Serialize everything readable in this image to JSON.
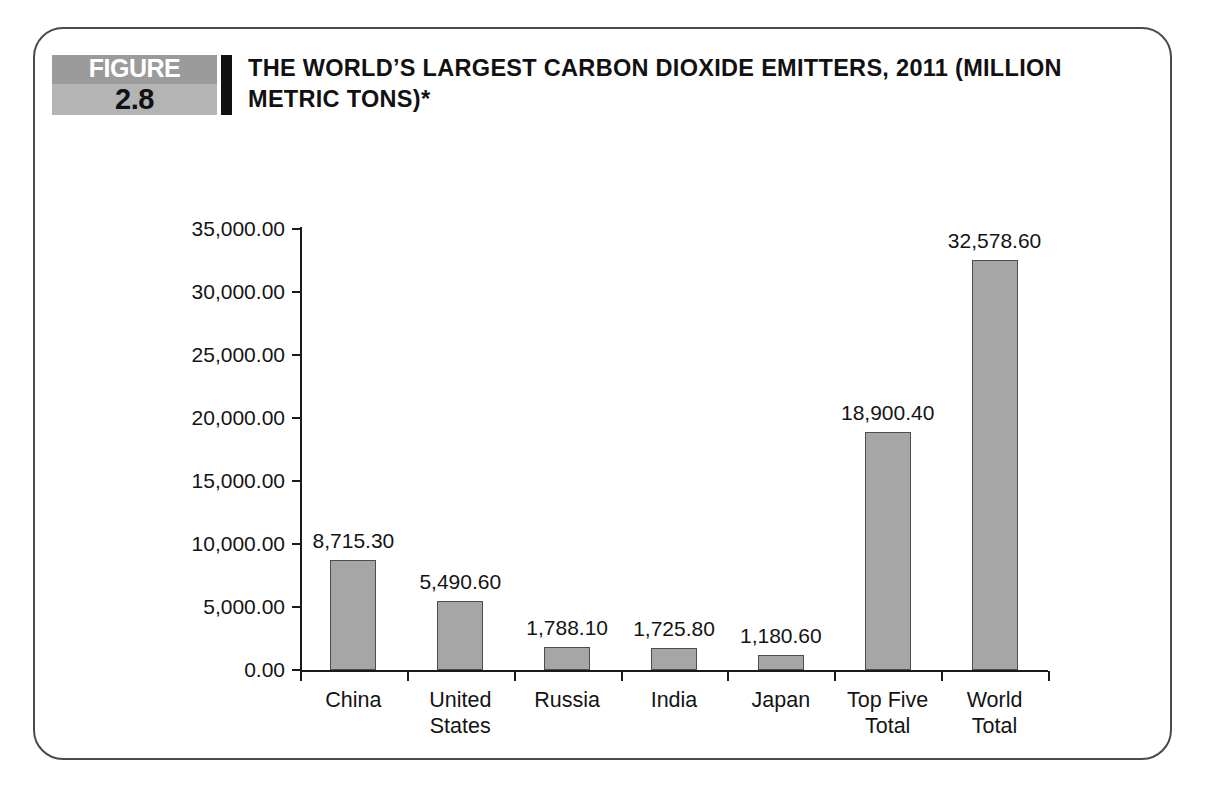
{
  "figure": {
    "badge_word": "FIGURE",
    "badge_number": "2.8",
    "title": "THE WORLD’S LARGEST CARBON DIOXIDE EMITTERS, 2011 (MILLION METRIC TONS)*"
  },
  "colors": {
    "bar_fill": "#a6a6a6",
    "bar_stroke": "#4d4d4d",
    "axis": "#1a1a1a",
    "badge_top": "#9b9b9b",
    "badge_bottom": "#b4b4b4",
    "badge_bar": "#111111",
    "card_border": "#4a4a4a"
  },
  "chart_data": {
    "type": "bar",
    "title": "THE WORLD’S LARGEST CARBON DIOXIDE EMITTERS, 2011 (MILLION METRIC TONS)*",
    "xlabel": "",
    "ylabel": "",
    "ylim": [
      0,
      35000
    ],
    "grid": false,
    "legend": false,
    "categories": [
      "China",
      "United States",
      "Russia",
      "India",
      "Japan",
      "Top Five Total",
      "World Total"
    ],
    "category_lines": [
      [
        "China"
      ],
      [
        "United",
        "States"
      ],
      [
        "Russia"
      ],
      [
        "India"
      ],
      [
        "Japan"
      ],
      [
        "Top Five",
        "Total"
      ],
      [
        "World",
        "Total"
      ]
    ],
    "values": [
      8715.3,
      5490.6,
      1788.1,
      1725.8,
      1180.6,
      18900.4,
      32578.6
    ],
    "value_labels": [
      "8,715.30",
      "5,490.60",
      "1,788.10",
      "1,725.80",
      "1,180.60",
      "18,900.40",
      "32,578.60"
    ],
    "ytick_values": [
      0,
      5000,
      10000,
      15000,
      20000,
      25000,
      30000,
      35000
    ],
    "ytick_labels": [
      "0.00",
      "5,000.00",
      "10,000.00",
      "15,000.00",
      "20,000.00",
      "25,000.00",
      "30,000.00",
      "35,000.00"
    ]
  }
}
